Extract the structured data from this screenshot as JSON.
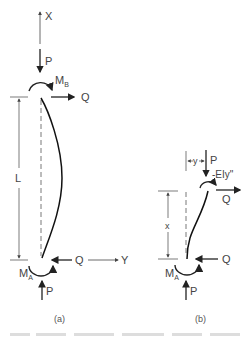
{
  "diagram": {
    "panel_a": {
      "caption": "(a)",
      "labels": {
        "x_axis": "X",
        "y_axis": "Y",
        "load_top": "P",
        "load_bottom": "P",
        "moment_top": "M",
        "moment_top_sub": "B",
        "moment_bottom": "M",
        "moment_bottom_sub": "A",
        "shear_top": "Q",
        "shear_bottom": "Q",
        "length": "L"
      }
    },
    "panel_b": {
      "caption": "(b)",
      "labels": {
        "deflection": "y",
        "load_top": "P",
        "load_bottom": "P",
        "internal_moment": "-EIy\"",
        "shear_top": "Q",
        "shear_bottom": "Q",
        "moment_bottom": "M",
        "moment_bottom_sub": "A",
        "distance": "x"
      }
    }
  }
}
